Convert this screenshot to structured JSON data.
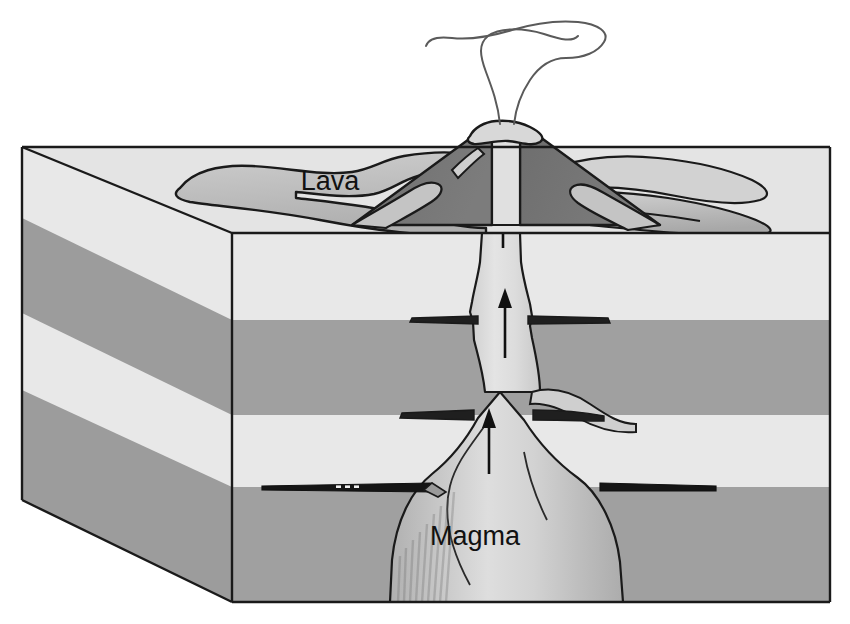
{
  "diagram": {
    "view": "three-dimensional cutaway block",
    "labels": {
      "lava": "Lava",
      "magma": "Magma"
    },
    "label_positions": {
      "lava": {
        "x": 330,
        "y": 190
      },
      "magma": {
        "x": 475,
        "y": 545
      }
    },
    "colors": {
      "background": "#ffffff",
      "outline": "#1a1a1a",
      "rock_light": "#e8e8e8",
      "rock_light_top": "#e2e2e2",
      "rock_mid": "#a0a0a0",
      "rock_mid_dark": "#9a9a9a",
      "lava_light": "#c9c9c9",
      "lava_mid": "#b4b4b4",
      "cone_dark": "#737373",
      "magma_light": "#d6d6d6",
      "magma_mid": "#bcbcbc",
      "conduit_fill": "#dcdcdc",
      "smoke_stroke": "#555555"
    },
    "block": {
      "front_top_left": {
        "x": 232,
        "y": 233
      },
      "front_top_right": {
        "x": 830,
        "y": 233
      },
      "front_bottom_left": {
        "x": 232,
        "y": 602
      },
      "front_bottom_right": {
        "x": 830,
        "y": 602
      },
      "back_top_left": {
        "x": 22,
        "y": 147
      },
      "back_bottom_left": {
        "x": 22,
        "y": 500
      },
      "top_back_right": {
        "x": 830,
        "y": 147
      }
    },
    "strata": {
      "count": 4,
      "front_boundaries_y": [
        233,
        320,
        415,
        487,
        602
      ],
      "shades": [
        "rock_light",
        "rock_mid",
        "rock_light",
        "rock_mid"
      ]
    },
    "features": [
      {
        "name": "volcano-cone",
        "kind": "cone",
        "shade": "cone_dark"
      },
      {
        "name": "summit-crater",
        "kind": "crater"
      },
      {
        "name": "smoke-plume",
        "kind": "plume",
        "strands": 2
      },
      {
        "name": "central-conduit",
        "kind": "conduit"
      },
      {
        "name": "magma-chamber",
        "kind": "chamber"
      },
      {
        "name": "sill-upper-left",
        "kind": "sill"
      },
      {
        "name": "sill-upper-right",
        "kind": "sill"
      },
      {
        "name": "sill-mid-left",
        "kind": "sill"
      },
      {
        "name": "sill-mid-right",
        "kind": "sill"
      },
      {
        "name": "sill-lower-left",
        "kind": "sill"
      },
      {
        "name": "sill-lower-right",
        "kind": "sill"
      },
      {
        "name": "lava-flow-left",
        "kind": "lava-lobe"
      },
      {
        "name": "lava-flow-right",
        "kind": "lava-lobe"
      }
    ],
    "flow_arrows": {
      "count": 3,
      "direction": "upward",
      "positions": [
        {
          "x": 503,
          "y_tail": 245,
          "y_head": 176
        },
        {
          "x": 505,
          "y_tail": 355,
          "y_head": 295
        },
        {
          "x": 489,
          "y_tail": 470,
          "y_head": 415
        }
      ]
    }
  }
}
